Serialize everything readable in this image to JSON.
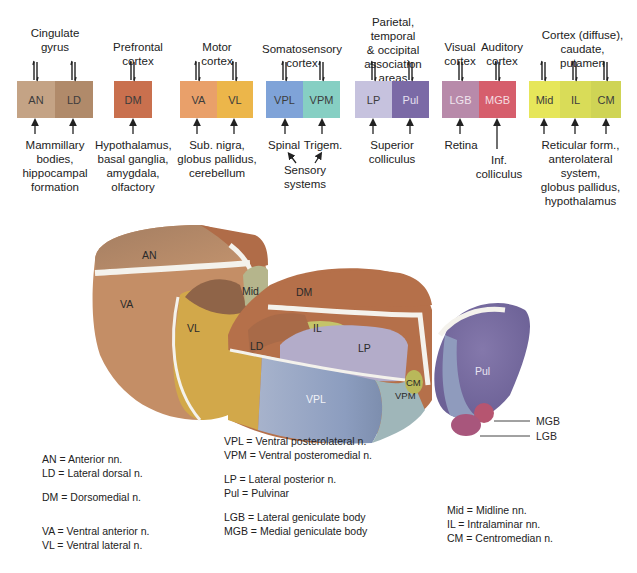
{
  "groups": [
    {
      "id": "cingulate",
      "top_label": "Cingulate gyrus",
      "top_lines": [
        "Cingulate",
        "gyrus"
      ],
      "nuclei": [
        {
          "abbr": "AN",
          "color": "#c4a385"
        },
        {
          "abbr": "LD",
          "color": "#b08a6a"
        }
      ],
      "bottom_lines": [
        "Mammillary",
        "bodies,",
        "hippocampal",
        "formation"
      ]
    },
    {
      "id": "prefrontal",
      "top_lines": [
        "Prefrontal",
        "cortex"
      ],
      "nuclei": [
        {
          "abbr": "DM",
          "color": "#c9704e"
        }
      ],
      "bottom_lines": [
        "Hypothalamus,",
        "basal ganglia,",
        "amygdala,",
        "olfactory"
      ]
    },
    {
      "id": "motor",
      "top_lines": [
        "Motor",
        "cortex"
      ],
      "nuclei": [
        {
          "abbr": "VA",
          "color": "#e9a06a"
        },
        {
          "abbr": "VL",
          "color": "#ecb64a"
        }
      ],
      "bottom_lines": [
        "Sub. nigra,",
        "globus pallidus,",
        "cerebellum"
      ]
    },
    {
      "id": "somatosensory",
      "top_lines": [
        "Somatosensory",
        "cortex"
      ],
      "nuclei": [
        {
          "abbr": "VPL",
          "color": "#7fa3d8"
        },
        {
          "abbr": "VPM",
          "color": "#86cfc3"
        }
      ],
      "bottom_left": "Spinal",
      "bottom_right": "Trigem.",
      "bottom_lines": [
        "Sensory",
        "systems"
      ]
    },
    {
      "id": "association",
      "top_lines": [
        "Parietal, temporal",
        "& occipital",
        "association",
        "areas"
      ],
      "nuclei": [
        {
          "abbr": "LP",
          "color": "#c6c2de"
        },
        {
          "abbr": "Pul",
          "color": "#7b6aa6"
        }
      ],
      "bottom_lines": [
        "Superior",
        "colliculus"
      ]
    },
    {
      "id": "visual",
      "top_lines": [
        "Visual",
        "cortex"
      ],
      "nuclei": [
        {
          "abbr": "LGB",
          "color": "#b88aaa"
        }
      ],
      "bottom_lines": [
        "Retina"
      ]
    },
    {
      "id": "auditory",
      "top_lines": [
        "Auditory",
        "cortex"
      ],
      "nuclei": [
        {
          "abbr": "MGB",
          "color": "#d65e6c"
        }
      ],
      "bottom_lines": [
        "Inf.",
        "colliculus"
      ]
    },
    {
      "id": "diffuse",
      "top_lines": [
        "Cortex (diffuse),",
        "caudate,",
        "putamen"
      ],
      "nuclei": [
        {
          "abbr": "Mid",
          "color": "#e6e65a"
        },
        {
          "abbr": "IL",
          "color": "#d9dc58"
        },
        {
          "abbr": "CM",
          "color": "#cfd455"
        }
      ],
      "bottom_lines": [
        "Reticular form.,",
        "anterolateral",
        "system,",
        "globus pallidus,",
        "hypothalamus"
      ]
    }
  ],
  "illustration": {
    "labels": {
      "AN": "AN",
      "VA": "VA",
      "VL": "VL",
      "Mid": "Mid",
      "DM": "DM",
      "IL": "IL",
      "LD": "LD",
      "LP": "LP",
      "VPL": "VPL",
      "VPM": "VPM",
      "CM": "CM",
      "Pul": "Pul",
      "MGB": "MGB",
      "LGB": "LGB"
    },
    "colors": {
      "AN": "#b98a68",
      "VA": "#c99068",
      "VL": "#d2a84a",
      "Mid": "#b5b58c",
      "DM": "#b5704a",
      "LD": "#a86a48",
      "IL": "#c4c46a",
      "LP": "#b3acc9",
      "VPL": "#95a5c4",
      "VPM": "#9fb6b9",
      "CM": "#b9b85a",
      "Pul": "#7d72a4",
      "MGB": "#b65570",
      "LGB": "#a8567c",
      "lamina": "#f4f2ec"
    }
  },
  "legend": {
    "col1": [
      [
        "AN = Anterior nn.",
        "LD = Lateral dorsal n."
      ],
      [
        "DM = Dorsomedial n."
      ],
      [
        "VA = Ventral anterior n.",
        "VL = Ventral lateral n."
      ]
    ],
    "col2": [
      [
        "VPL = Ventral posterolateral n.",
        "VPM = Ventral posteromedial n."
      ],
      [
        "LP = Lateral posterior n.",
        "Pul = Pulvinar"
      ],
      [
        "LGB = Lateral geniculate body",
        "MGB = Medial geniculate body"
      ]
    ],
    "col3": [
      [
        "Mid = Midline nn.",
        "IL = Intralaminar nn.",
        "CM = Centromedian n."
      ]
    ]
  }
}
